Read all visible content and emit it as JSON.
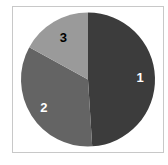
{
  "chart_data": {
    "type": "pie",
    "title": "",
    "legend": "none",
    "start_angle_deg": 0,
    "direction": "clockwise",
    "categories": [
      "1",
      "2",
      "3"
    ],
    "values": [
      49,
      34,
      17
    ],
    "unit": "percent (estimated)",
    "colors": [
      "#3c3c3c",
      "#646464",
      "#9a9a9a"
    ],
    "label_colors": [
      "#ffffff",
      "#ffffff",
      "#000000"
    ],
    "labels": [
      "1",
      "2",
      "3"
    ]
  },
  "frame": {
    "border_color": "#c8c8c8"
  }
}
